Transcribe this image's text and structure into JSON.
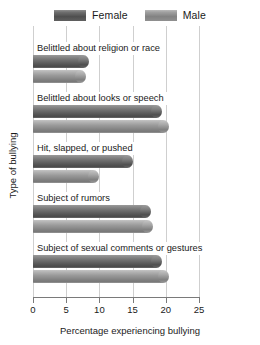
{
  "chart_data": {
    "type": "bar",
    "orientation": "horizontal",
    "title": "",
    "xlabel": "Percentage experiencing bullying",
    "ylabel": "Type of bullying",
    "xlim": [
      0,
      25
    ],
    "xticks": [
      0,
      5,
      10,
      15,
      20,
      25
    ],
    "grid": true,
    "legend_position": "top-center",
    "categories": [
      "Belittled about religion or race",
      "Belittled about looks or speech",
      "Hit, slapped, or pushed",
      "Subject of rumors",
      "Subject of sexual comments or gestures"
    ],
    "series": [
      {
        "name": "Female",
        "color": "#5a5a5a",
        "values": [
          8.5,
          19.5,
          15.0,
          17.8,
          19.5
        ]
      },
      {
        "name": "Male",
        "color": "#9a9a9a",
        "values": [
          8.0,
          20.5,
          10.0,
          18.0,
          20.5
        ]
      }
    ]
  },
  "legend": {
    "entries": [
      {
        "label": "Female",
        "swatch": "female-swatch"
      },
      {
        "label": "Male",
        "swatch": "male-swatch"
      }
    ]
  },
  "axis": {
    "x_tick_labels": [
      "0",
      "5",
      "10",
      "15",
      "20",
      "25"
    ],
    "x_title": "Percentage experiencing bullying",
    "y_title": "Type of bullying"
  }
}
